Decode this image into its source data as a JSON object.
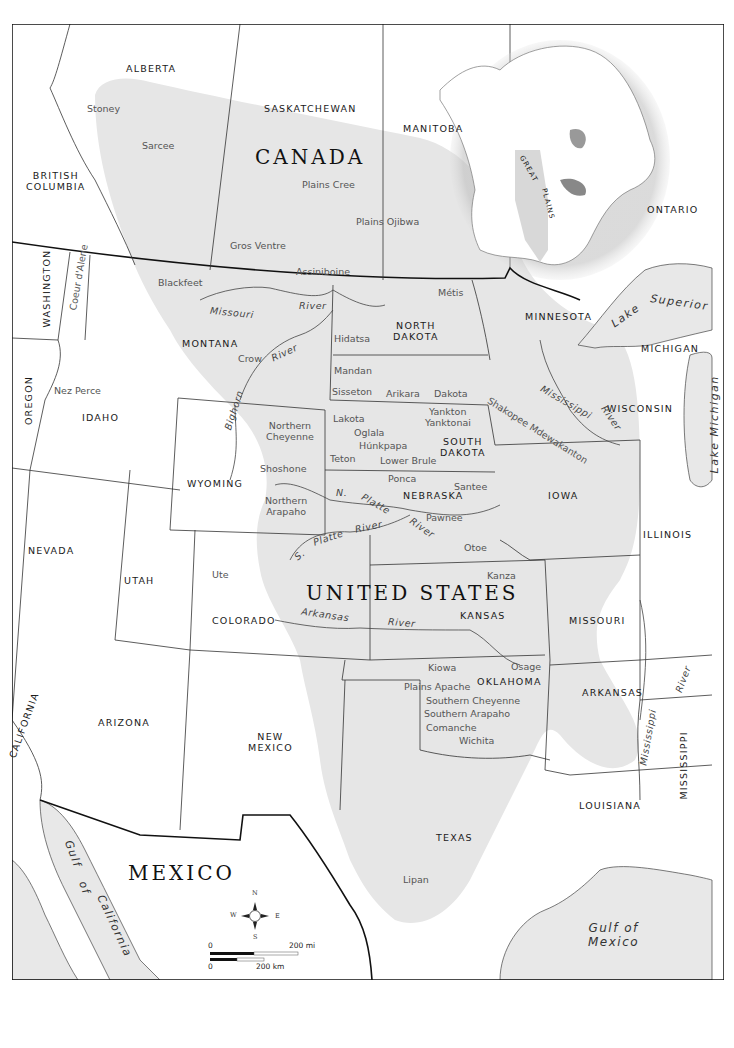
{
  "map": {
    "countries": {
      "canada": "CANADA",
      "united_states": "UNITED STATES",
      "mexico": "MEXICO"
    },
    "provinces": {
      "alberta": "ALBERTA",
      "saskatchewan": "SASKATCHEWAN",
      "manitoba": "MANITOBA",
      "british_columbia_1": "BRITISH",
      "british_columbia_2": "COLUMBIA",
      "ontario": "ONTARIO"
    },
    "states": {
      "washington": "WASHINGTON",
      "oregon": "OREGON",
      "idaho": "IDAHO",
      "montana": "MONTANA",
      "north_dakota_1": "NORTH",
      "north_dakota_2": "DAKOTA",
      "south_dakota_1": "SOUTH",
      "south_dakota_2": "DAKOTA",
      "minnesota": "MINNESOTA",
      "michigan": "MICHIGAN",
      "wisconsin": "WISCONSIN",
      "wyoming": "WYOMING",
      "nebraska": "NEBRASKA",
      "iowa": "IOWA",
      "illinois": "ILLINOIS",
      "nevada": "NEVADA",
      "utah": "UTAH",
      "colorado": "COLORADO",
      "kansas": "KANSAS",
      "missouri": "MISSOURI",
      "california": "CALIFORNIA",
      "arizona": "ARIZONA",
      "new_mexico_1": "NEW",
      "new_mexico_2": "MEXICO",
      "oklahoma": "OKLAHOMA",
      "arkansas": "ARKANSAS",
      "mississippi": "MISSISSIPPI",
      "louisiana": "LOUISIANA",
      "texas": "TEXAS"
    },
    "tribes": {
      "stoney": "Stoney",
      "sarcee": "Sarcee",
      "plains_cree": "Plains Cree",
      "plains_ojibwa": "Plains Ojibwa",
      "gros_ventre": "Gros Ventre",
      "assiniboine": "Assiniboine",
      "blackfeet": "Blackfeet",
      "coeur_dalene": "Coeur d'Alene",
      "metis": "Métis",
      "nez_perce": "Nez Perce",
      "hidatsa": "Hidatsa",
      "mandan": "Mandan",
      "sisseton": "Sisseton",
      "arikara": "Arikara",
      "dakota": "Dakota",
      "yankton": "Yankton",
      "yanktonai": "Yanktonai",
      "lakota": "Lakota",
      "oglala": "Oglala",
      "hunkpapa": "Húnkpapa",
      "teton": "Teton",
      "lower_brule": "Lower Brule",
      "shakopee": "Shakopee Mdewakanton",
      "crow": "Crow",
      "northern_cheyenne_1": "Northern",
      "northern_cheyenne_2": "Cheyenne",
      "shoshone": "Shoshone",
      "northern_arapaho_1": "Northern",
      "northern_arapaho_2": "Arapaho",
      "ponca": "Ponca",
      "santee": "Santee",
      "pawnee": "Pawnee",
      "otoe": "Otoe",
      "ute": "Ute",
      "kanza": "Kanza",
      "kiowa": "Kiowa",
      "osage": "Osage",
      "plains_apache": "Plains Apache",
      "southern_cheyenne": "Southern Cheyenne",
      "southern_arapaho": "Southern Arapaho",
      "comanche": "Comanche",
      "wichita": "Wichita",
      "lipan": "Lipan"
    },
    "rivers": {
      "missouri": "Missouri",
      "missouri_river": "River",
      "crow_river": "River",
      "bighorn": "Bighorn",
      "mississippi_upper": "Mississippi",
      "mississippi_upper_river": "River",
      "n_platte_n": "N.",
      "n_platte": "Platte",
      "n_platte_river": "River",
      "s_platte_s": "S.",
      "s_platte": "Platte",
      "s_platte_river": "River",
      "arkansas": "Arkansas",
      "arkansas_river": "River",
      "mississippi_lower": "Mississippi",
      "mississippi_lower_river": "River"
    },
    "water_bodies": {
      "lake_superior_1": "Lake",
      "lake_superior_2": "Superior",
      "lake_michigan": "Lake Michigan",
      "gulf_of_california_1": "Gulf",
      "gulf_of_california_2": "of",
      "gulf_of_california_3": "California",
      "gulf_of_mexico_1": "Gulf of",
      "gulf_of_mexico_2": "Mexico"
    },
    "inset": {
      "label_1": "GREAT",
      "label_2": "PLAINS"
    },
    "compass": {
      "n": "N",
      "s": "S",
      "e": "E",
      "w": "W"
    },
    "scale_bar": {
      "mi_zero": "0",
      "mi_label": "200 mi",
      "km_zero": "0",
      "km_label": "200 km"
    },
    "colors": {
      "plains_region": "#e6e6e6",
      "water": "#e8e8e8",
      "border": "#222222",
      "background": "#ffffff"
    }
  }
}
